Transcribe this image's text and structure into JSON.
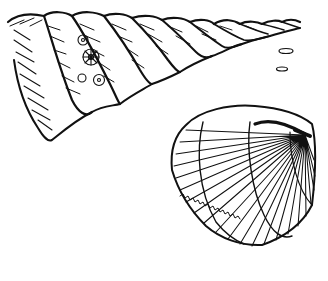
{
  "illustration": {
    "style": "black-and-white engraving",
    "background_color": "#ffffff",
    "ink_color": "#111111",
    "subjects": [
      {
        "name": "turreted spiral shell",
        "detail": "elongated tower shell with whorls tapering to the upper right, decorated with small rosette flowers on one whorl"
      },
      {
        "name": "cockle bivalve shell",
        "detail": "rounded ribbed bivalve with radiating ribs and concentric growth lines"
      }
    ],
    "small_marks": [
      "two small oval pebbles to the right of the spire tip"
    ]
  }
}
